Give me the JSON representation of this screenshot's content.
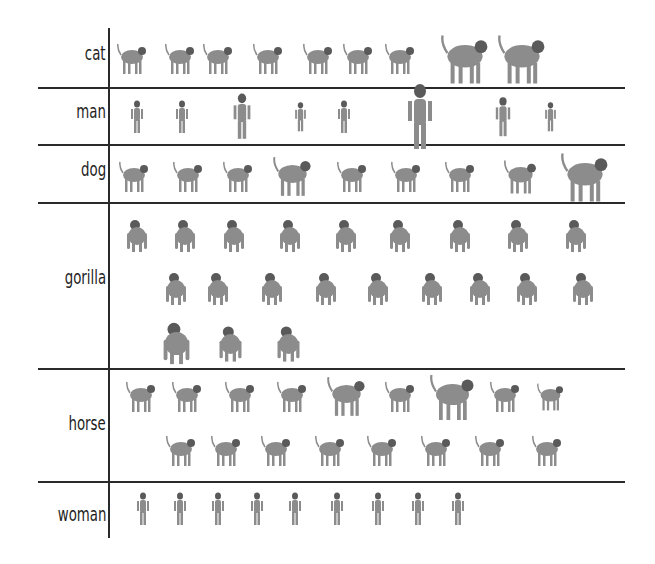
{
  "categories": [
    {
      "label": "cat",
      "count": 9,
      "label_y": 44,
      "rows": [
        {
          "y": 40,
          "xs": [
            132,
            180,
            218,
            268,
            318,
            358,
            400,
            465,
            522
          ],
          "sizes": [
            1,
            1,
            1,
            1,
            1,
            1,
            1,
            1.6,
            1.6
          ]
        }
      ]
    },
    {
      "label": "man",
      "count": 9,
      "label_y": 102,
      "rows": [
        {
          "y": 98,
          "xs": [
            137,
            182,
            242,
            300,
            344,
            420,
            503,
            550
          ],
          "sizes": [
            1,
            1,
            1.4,
            0.9,
            1,
            2,
            1.2,
            0.9
          ]
        }
      ]
    },
    {
      "label": "dog",
      "count": 9,
      "label_y": 161,
      "rows": [
        {
          "y": 158,
          "xs": [
            134,
            188,
            238,
            292,
            352,
            406,
            460,
            520,
            585
          ],
          "sizes": [
            1,
            1,
            1,
            1.3,
            1,
            1,
            1,
            1.1,
            1.6
          ]
        }
      ]
    },
    {
      "label": "gorilla",
      "count": 22,
      "label_y": 268,
      "rows": [
        {
          "y": 217,
          "xs": [
            137,
            185,
            234,
            290,
            346,
            400,
            460,
            518,
            576
          ]
        },
        {
          "y": 270,
          "xs": [
            176,
            218,
            272,
            326,
            378,
            432,
            480,
            527,
            583
          ]
        },
        {
          "y": 325,
          "xs": [
            176,
            230,
            288
          ],
          "sizes": [
            1.3,
            1.1,
            1.1
          ]
        }
      ]
    },
    {
      "label": "horse",
      "count": 17,
      "label_y": 414,
      "rows": [
        {
          "y": 378,
          "xs": [
            141,
            187,
            240,
            292,
            346,
            400,
            452,
            505,
            550
          ],
          "sizes": [
            1,
            1,
            1,
            1,
            1.3,
            1,
            1.5,
            1,
            0.9
          ]
        },
        {
          "y": 432,
          "xs": [
            181,
            226,
            276,
            330,
            382,
            436,
            490,
            547
          ]
        }
      ]
    },
    {
      "label": "woman",
      "count": 9,
      "label_y": 504,
      "rows": [
        {
          "y": 490,
          "xs": [
            143,
            180,
            218,
            257,
            295,
            337,
            378,
            418,
            458
          ]
        }
      ]
    }
  ],
  "separators_y": [
    87,
    144,
    202,
    368,
    481
  ],
  "colors": {
    "line": "#2a2a2a",
    "text": "#1e1e1e",
    "figure": "#8c8c8c",
    "figure_dark": "#5a5a5a"
  }
}
